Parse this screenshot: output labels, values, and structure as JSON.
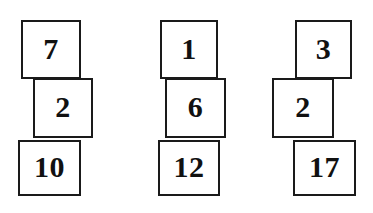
{
  "figure": {
    "type": "block-stacks-diagram",
    "background_color": "#ffffff",
    "block_fill_color": "#ffffff",
    "block_border_color": "#1a1a1a",
    "text_color": "#111111",
    "stacks": [
      {
        "name": "stack-1",
        "blocks": [
          {
            "label": "7",
            "x": 21,
            "y": 20,
            "w": 60,
            "h": 59
          },
          {
            "label": "2",
            "x": 33,
            "y": 78,
            "w": 60,
            "h": 60
          },
          {
            "label": "10",
            "x": 18,
            "y": 140,
            "w": 63,
            "h": 56
          }
        ]
      },
      {
        "name": "stack-2",
        "blocks": [
          {
            "label": "1",
            "x": 160,
            "y": 20,
            "w": 58,
            "h": 59
          },
          {
            "label": "6",
            "x": 165,
            "y": 78,
            "w": 61,
            "h": 60
          },
          {
            "label": "12",
            "x": 158,
            "y": 140,
            "w": 62,
            "h": 56
          }
        ]
      },
      {
        "name": "stack-3",
        "blocks": [
          {
            "label": "3",
            "x": 295,
            "y": 20,
            "w": 57,
            "h": 59
          },
          {
            "label": "2",
            "x": 272,
            "y": 78,
            "w": 62,
            "h": 60
          },
          {
            "label": "17",
            "x": 293,
            "y": 140,
            "w": 63,
            "h": 56
          }
        ]
      }
    ]
  }
}
